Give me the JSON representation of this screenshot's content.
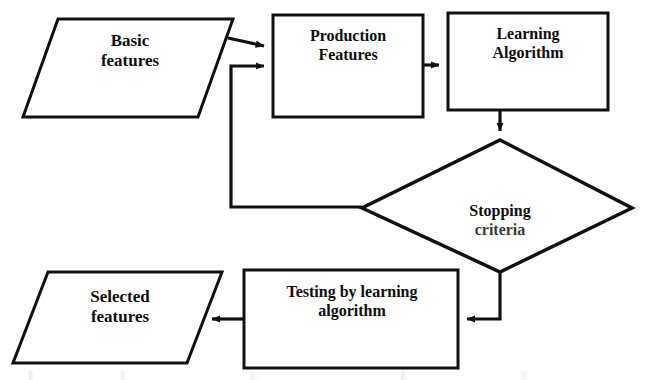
{
  "diagram": {
    "background_color": "#ffffff",
    "stroke_color": "#111111",
    "text_color": "#0d0d0d",
    "nodes": {
      "basic_features": {
        "label": "Basic\nfeatures",
        "shape": "parallelogram"
      },
      "production_features": {
        "label": "Production\nFeatures",
        "shape": "rectangle"
      },
      "learning_algorithm": {
        "label": "Learning\nAlgorithm",
        "shape": "rectangle"
      },
      "stopping_criteria": {
        "label_line1": "Stopping",
        "label_line2": "criteria",
        "shape": "diamond"
      },
      "testing_by_learning_algorithm": {
        "label": "Testing by learning\nalgorithm",
        "shape": "rectangle"
      },
      "selected_features": {
        "label": "Selected\nfeatures",
        "shape": "parallelogram"
      }
    },
    "edges": [
      {
        "name": "basic-to-production",
        "from": "basic_features",
        "to": "production_features",
        "label": ""
      },
      {
        "name": "production-to-learning",
        "from": "production_features",
        "to": "learning_algorithm",
        "label": ""
      },
      {
        "name": "learning-to-stopping",
        "from": "learning_algorithm",
        "to": "stopping_criteria",
        "label": ""
      },
      {
        "name": "stopping-feedback-to-production",
        "from": "stopping_criteria",
        "to": "production_features",
        "label": ""
      },
      {
        "name": "stopping-to-testing",
        "from": "stopping_criteria",
        "to": "testing_by_learning_algorithm",
        "label": ""
      },
      {
        "name": "testing-to-selected",
        "from": "testing_by_learning_algorithm",
        "to": "selected_features",
        "label": ""
      }
    ]
  }
}
